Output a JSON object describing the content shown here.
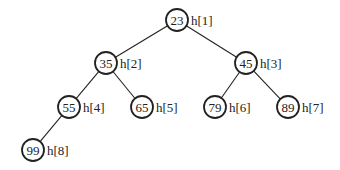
{
  "diagram": {
    "type": "binary-heap-tree",
    "nodes": [
      {
        "id": 1,
        "value": "23",
        "label": "h[1]",
        "x": 177,
        "y": 20
      },
      {
        "id": 2,
        "value": "35",
        "label": "h[2]",
        "x": 106,
        "y": 63
      },
      {
        "id": 3,
        "value": "45",
        "label": "h[3]",
        "x": 246,
        "y": 63
      },
      {
        "id": 4,
        "value": "55",
        "label": "h[4]",
        "x": 69,
        "y": 107
      },
      {
        "id": 5,
        "value": "65",
        "label": "h[5]",
        "x": 142,
        "y": 107
      },
      {
        "id": 6,
        "value": "79",
        "label": "h[6]",
        "x": 215,
        "y": 107
      },
      {
        "id": 7,
        "value": "89",
        "label": "h[7]",
        "x": 288,
        "y": 107
      },
      {
        "id": 8,
        "value": "99",
        "label": "h[8]",
        "x": 33,
        "y": 150
      }
    ],
    "edges": [
      [
        1,
        2
      ],
      [
        1,
        3
      ],
      [
        2,
        4
      ],
      [
        2,
        5
      ],
      [
        3,
        6
      ],
      [
        3,
        7
      ],
      [
        4,
        8
      ]
    ],
    "colors": {
      "stroke": "#222222",
      "text": "#222222",
      "background": "#ffffff"
    }
  }
}
